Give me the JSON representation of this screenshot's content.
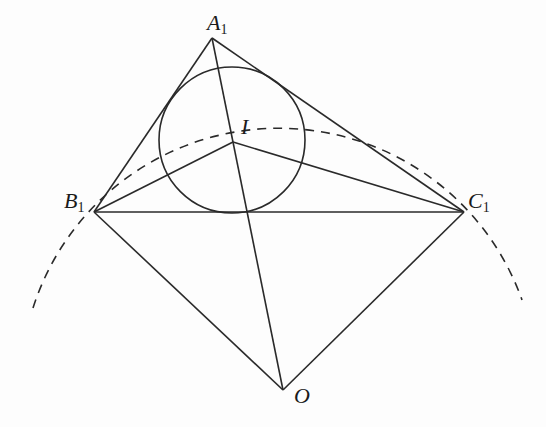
{
  "diagram": {
    "type": "geometry",
    "stroke_color": "#2a2a2a",
    "points": {
      "A1": {
        "label": "A",
        "sub": "1",
        "x": 212,
        "y": 38
      },
      "B1": {
        "label": "B",
        "sub": "1",
        "x": 94,
        "y": 212
      },
      "C1": {
        "label": "C",
        "sub": "1",
        "x": 464,
        "y": 212
      },
      "I": {
        "label": "I",
        "sub": "",
        "x": 233,
        "y": 142
      },
      "O": {
        "label": "O",
        "sub": "",
        "x": 283,
        "y": 390
      }
    },
    "segments": [
      [
        "A1",
        "B1"
      ],
      [
        "A1",
        "C1"
      ],
      [
        "B1",
        "C1"
      ],
      [
        "A1",
        "O"
      ],
      [
        "B1",
        "O"
      ],
      [
        "C1",
        "O"
      ],
      [
        "I",
        "B1"
      ],
      [
        "I",
        "C1"
      ]
    ],
    "incircle": {
      "center": "I",
      "cx": 232,
      "cy": 140,
      "r": 73
    },
    "dashed_arc": {
      "center": "O",
      "from": [
        33,
        308
      ],
      "to": [
        522,
        300
      ],
      "r": 258
    }
  }
}
